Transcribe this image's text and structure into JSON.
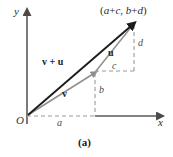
{
  "figure": {
    "caption": "(a)",
    "background_color": "#ffffff",
    "axes": {
      "x_label": "x",
      "y_label": "y",
      "origin_label": "O",
      "axis_color": "#555555",
      "dashed_color": "#8a8a8a"
    },
    "labels": {
      "point": {
        "open_paren": "(",
        "a": "a",
        "plus1": "+",
        "c": "c",
        "comma": ", ",
        "b": "b",
        "plus2": "+",
        "d": "d",
        "close_paren": ")",
        "full": "(a+c, b+d)"
      },
      "vector_sum": "v + u",
      "vector_v": "v",
      "vector_u": "u",
      "component_a": "a",
      "component_b": "b",
      "component_c": "c",
      "component_d": "d"
    },
    "colors": {
      "vector_sum_color": "#1c1c1c",
      "vector_v_color": "#8f8f8f",
      "vector_u_color": "#8f8f8f",
      "dashed_color": "#9a9a9a",
      "axis_color": "#5a5a5a"
    },
    "geometry": {
      "origin": [
        27,
        116
      ],
      "v_tip": [
        95,
        72
      ],
      "sum_tip": [
        134,
        23
      ],
      "x_axis_end": [
        160,
        116
      ],
      "y_axis_top": [
        27,
        12
      ]
    }
  }
}
